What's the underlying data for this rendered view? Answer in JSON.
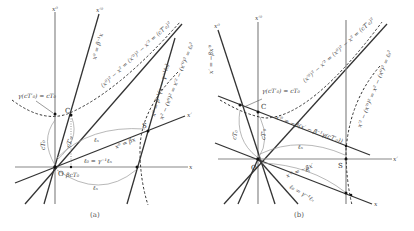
{
  "figure": {
    "panels": [
      {
        "id": "a",
        "caption": "(a)",
        "axes": {
          "x0": "x⁰",
          "x0p": "x′⁰",
          "x": "x",
          "xp": "x′"
        },
        "points": {
          "origin": "O",
          "clock": "C",
          "event": "S"
        },
        "labels": {
          "gamma_eq": "γ(cT′₀) = cT₀",
          "hyperbola_time": "(x⁰)² − x² = (x′⁰)² − x′² = (cT′₀)²",
          "x0p_line": "x⁰ = β⁻¹x",
          "xp_line": "x⁰ = βx",
          "line_S": "x⁰ = β⁻¹(x − γ⁻¹ℓ₀)",
          "hyperbola_space": "x² − (x⁰)² = x′² − (x′⁰)² = ℓ₀²",
          "l_contracted": "ℓ₀ = γ⁻¹ℓₙ",
          "beta_cT": "βcT₀",
          "l_n_top": "ℓₙ",
          "l_n_bottom": "ℓₙ",
          "cT0": "cT₀",
          "cTp0": "cT′₀"
        }
      },
      {
        "id": "b",
        "caption": "(b)",
        "axes": {
          "x0": "x⁰",
          "x0p": "x′⁰",
          "x": "x",
          "xp": "x′"
        },
        "points": {
          "origin": "O",
          "clock": "C",
          "event": "S"
        },
        "labels": {
          "gamma_eq": "γ(cT′₀) = cT₀",
          "hyperbola_time": "(x′⁰)² − x′² = (x⁰)² − x² = (cT′₀)²",
          "x0_line": "x′ = −βx′⁰",
          "line_shift": "x′⁰ = −β(x′ − β⁻¹γ(cT′₀))",
          "x_line": "x′⁰ = −βx′",
          "hyperbola_space": "x′² − (x′⁰)² = x² − (x⁰)² = ℓ₀²",
          "l_contracted": "ℓ₀ = γ⁻¹ℓₙ",
          "l_n_top": "ℓₙ",
          "l_n_bottom": "ℓₙ",
          "cT0": "cT₀",
          "cTp0": "cT′₀"
        }
      }
    ]
  }
}
